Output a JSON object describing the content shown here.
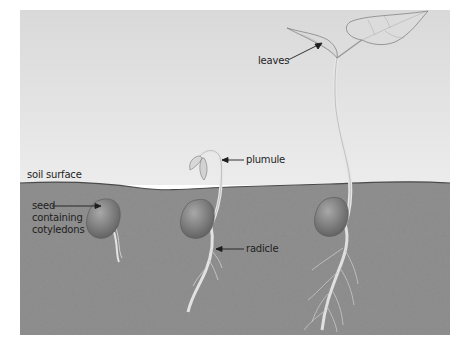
{
  "figure": {
    "stages": [
      {
        "id": "stage-1",
        "description": "Seed in soil with emerging radicle"
      },
      {
        "id": "stage-2",
        "description": "Seedling with hooked plumule emerging above soil and radicle growing down"
      },
      {
        "id": "stage-3",
        "description": "Young plant with first leaves above soil and branched roots"
      }
    ]
  },
  "labels": {
    "soil_surface": "soil surface",
    "seed_line1": "seed",
    "seed_line2": "containing",
    "seed_line3": "cotyledons",
    "plumule": "plumule",
    "radicle": "radicle",
    "leaves": "leaves"
  },
  "colors": {
    "background_panel": "#e6e6e6",
    "soil": "#8a8a8a",
    "seed": "#7a7a7a",
    "stem": "#e8e8e8",
    "label_text": "#1e1e1e"
  }
}
